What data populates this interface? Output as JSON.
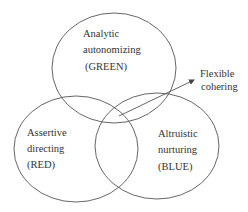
{
  "diagram": {
    "circles": [
      {
        "id": "green",
        "lines": [
          "Analytic",
          "autonomizing",
          "(GREEN)"
        ]
      },
      {
        "id": "red",
        "lines": [
          "Assertive",
          "directing",
          "(RED)"
        ]
      },
      {
        "id": "blue",
        "lines": [
          "Altruistic",
          "nurturing",
          "(BLUE)"
        ]
      }
    ],
    "callout": {
      "lines": [
        "Flexible",
        "cohering"
      ]
    }
  }
}
